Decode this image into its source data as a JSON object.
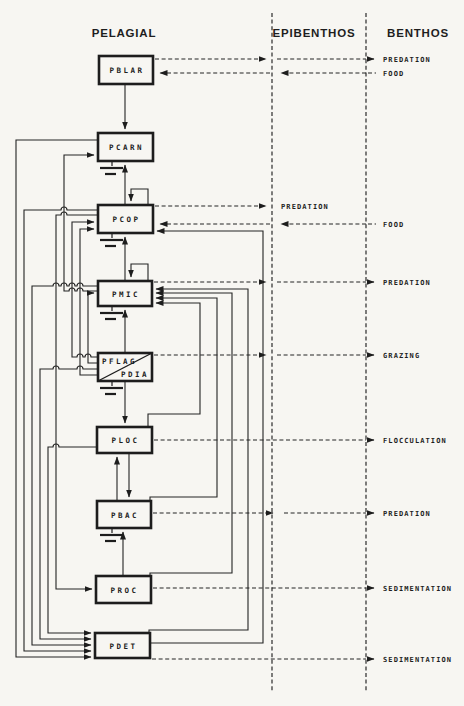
{
  "diagram": {
    "columns": {
      "pelagial": "PELAGIAL",
      "epibenthos": "EPIBENTHOS",
      "benthos": "BENTHOS"
    },
    "boxes": {
      "pblar": "PBLAR",
      "pcarn": "PCARN",
      "pcop": "PCOP",
      "pmic": "PMIC",
      "pflag": "PFLAG",
      "pdia": "PDIA",
      "ploc": "PLOC",
      "pbac": "PBAC",
      "proc": "PROC",
      "pdet": "PDET"
    },
    "flows": {
      "pblar_predation": "PREDATION",
      "pblar_food": "FOOD",
      "pcop_predation": "PREDATION",
      "pcop_food": "FOOD",
      "pmic_predation": "PREDATION",
      "pflag_grazing": "GRAZING",
      "ploc_flocculation": "FLOCCULATION",
      "pbac_predation": "PREDATION",
      "proc_sedimentation": "SEDIMENTATION",
      "pdet_sedimentation": "SEDIMENTATION"
    },
    "colors": {
      "ink": "#222222",
      "paper": "#f7f6f2"
    }
  }
}
